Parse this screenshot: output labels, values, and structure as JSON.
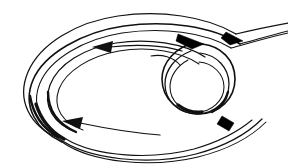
{
  "figure": {
    "background_color": "#ffffff",
    "ink_color": "#111111",
    "solid_mark_color": "#000000",
    "canvas": {
      "width": 288,
      "height": 168
    },
    "style": "monochrome technical line drawing, no text labels",
    "element_names": {
      "outer_spiral": "outer spiral ribbon band",
      "inner_coil": "tight inner coil loop",
      "entry_tail": "ribbon tail entering from upper right",
      "exit_tail": "ribbon tail sweeping out to lower right",
      "cut_end": "solid black parallelogram ribbon cut end",
      "flow_arrow_main": "counterclockwise flow arrowhead on inner band",
      "flow_arrow_lower": "counterclockwise flow arrowhead on lower band",
      "fold_wedge_top": "dark fold wedge at top of inner coil",
      "fold_wedge_entry": "dark fold wedge at ribbon entry",
      "fold_wedge_bottom": "dark fold shading at base of inner coil",
      "fold_wedge_left": "dark fold shading at lower left of outer spiral"
    },
    "flow_direction": "counterclockwise",
    "arrow_count": 2,
    "solid_mark_count": 1
  },
  "geometry": {
    "outer_spiral_paths": [
      "M 236 34 C 206 16 160 10 118 16 C 76 22 40 44 28 72 C 16 100 30 126 58 138",
      "M 240 44 C 212 26 166 20 124 26 C 82 32 44 54 33 80 C 22 106 36 130 62 142",
      "M 231 48 C 205 32 162 27 122 33 C 84 39 50 59 40 83 C 30 107 43 128 66 139"
    ],
    "inner_band_paths": [
      "M 205 57 C 184 43 148 38 116 43 C 84 48 58 64 50 85 C 42 106 54 124 76 132",
      "M 199 64 C 180 51 148 46 119 51 C 90 56 66 71 59 89 C 52 108 63 123 83 130"
    ],
    "inner_coil_paths": [
      "M 196 42 C 176 47 162 62 162 79 C 162 99 179 114 199 114 C 219 114 235 99 235 79 C 235 60 221 46 202 44",
      "M 191 51 C 175 57 165 70 165 84 C 165 101 179 114 197 114 C 215 114 229 100 229 84 C 229 68 217 55 200 53",
      "M 188 60 C 177 66 170 76 170 87 C 170 101 182 112 197 112 C 212 112 224 100 224 87 C 224 74 213 63 199 62"
    ],
    "exit_tail_paths": [
      "M 58 138 C 88 160 150 166 196 154 C 226 146 248 133 262 119",
      "M 62 142 C 92 163 152 168 198 157 C 230 149 252 136 266 122",
      "M 66 139 C 96 157 152 160 194 149 C 222 141 240 130 252 120"
    ],
    "entry_tail_paths": [
      "M 236 34 C 248 31 266 27 288 23",
      "M 240 44 C 252 41 268 36 288 31",
      "M 231 48 C 246 44 266 38 288 33"
    ],
    "cut_end_polygon": "222,116 234,123 229,131 217,124",
    "arrowheads": [
      {
        "points": "92,47 113,41 111,53",
        "name": "flow-arrow-main"
      },
      {
        "points": "62,121 83,117 80,129",
        "name": "flow-arrow-lower"
      }
    ],
    "fold_wedges": [
      {
        "points": "178,34 204,44 192,49 176,41",
        "name": "fold-wedge-top"
      },
      {
        "points": "226,32 243,41 230,45 221,38",
        "name": "fold-wedge-entry"
      }
    ]
  }
}
